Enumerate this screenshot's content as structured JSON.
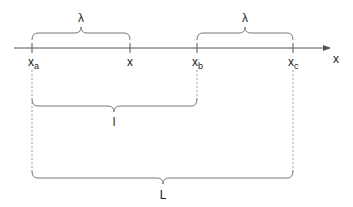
{
  "diagram": {
    "axis": {
      "label": "x",
      "color": "#555555"
    },
    "ticks": [
      {
        "id": "xa",
        "base": "x",
        "sub": "a"
      },
      {
        "id": "x",
        "base": "x",
        "sub": ""
      },
      {
        "id": "xb",
        "base": "x",
        "sub": "b"
      },
      {
        "id": "xc",
        "base": "x",
        "sub": "c"
      }
    ],
    "braces": [
      {
        "label": "λ",
        "from": "xa",
        "to": "x",
        "position": "above-axis"
      },
      {
        "label": "λ",
        "from": "xb",
        "to": "xc",
        "position": "above-axis"
      },
      {
        "label": "l",
        "from": "xa",
        "to": "xb",
        "position": "below"
      },
      {
        "label": "L",
        "from": "xa",
        "to": "xc",
        "position": "bottom"
      }
    ]
  }
}
